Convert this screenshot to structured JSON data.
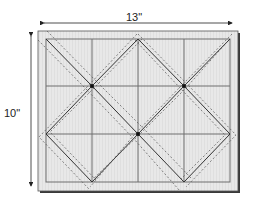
{
  "diagram": {
    "dimensions": {
      "width_label": "13\"",
      "height_label": "10\""
    },
    "colors": {
      "board_fill": "#e6e6e6",
      "board_border": "#2a2a2a",
      "shadow": "#3a3a3a",
      "grid_line": "#6e6e6e",
      "diagonal_line": "#333333",
      "dashed_line": "#555555",
      "node_dot": "#111111"
    },
    "grid": {
      "columns": 4,
      "rows": 3
    },
    "nodes": [
      {
        "x": 92,
        "y": 86
      },
      {
        "x": 184,
        "y": 86
      },
      {
        "x": 138,
        "y": 134
      }
    ]
  }
}
